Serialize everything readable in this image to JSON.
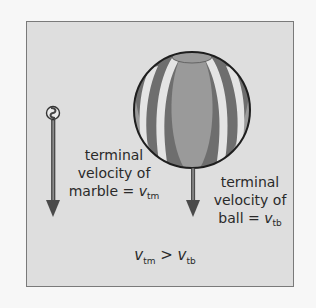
{
  "diagram": {
    "marble": {
      "label_lines": [
        "terminal",
        "velocity of",
        "marble = "
      ],
      "symbol": "v",
      "subscript": "tm"
    },
    "ball": {
      "label_lines": [
        "terminal",
        "velocity of",
        "ball = "
      ],
      "symbol": "v",
      "subscript": "tb"
    },
    "formula": {
      "left_symbol": "v",
      "left_subscript": "tm",
      "operator": " > ",
      "right_symbol": "v",
      "right_subscript": "tb"
    },
    "colors": {
      "frame_bg": "#dedede",
      "frame_border": "#7a7a7a",
      "arrow": "#555555",
      "ball_dark": "#6e6e6e",
      "ball_mid": "#9a9a9a",
      "ball_light": "#e4e4e4"
    }
  }
}
